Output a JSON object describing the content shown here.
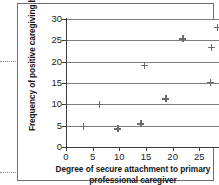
{
  "figure": {
    "margin_ticks": [
      "margin-tick-upper",
      "margin-tick-lower"
    ]
  },
  "chart_data": {
    "type": "scatter",
    "title": "",
    "subtitle": "",
    "xlabel": "Degree of secure attachment to primary professional caregiver",
    "xlabel_line1": "Degree of secure attachment to primary",
    "xlabel_line2": "professional caregiver",
    "ylabel": "Frequency of positive caregiving behaviour",
    "xlim": [
      0,
      30
    ],
    "ylim": [
      0,
      30
    ],
    "xticks": [
      0,
      5,
      10,
      15,
      20,
      25,
      30
    ],
    "yticks": [
      0,
      5,
      10,
      15,
      20,
      25,
      30
    ],
    "xtick_labels": [
      "0",
      "5",
      "10",
      "15",
      "20",
      "25",
      "30"
    ],
    "ytick_labels": [
      "0",
      "5",
      "10",
      "15",
      "20",
      "25",
      "30"
    ],
    "grid": true,
    "grid_axis": "y",
    "grid_values": [
      5,
      10,
      15,
      20,
      25,
      30
    ],
    "legend": null,
    "marker": "plus",
    "marker_color": "#6b6b6b",
    "axis_color": "#3a3a3a",
    "grid_color": "#7e7e7e",
    "series": [
      {
        "name": "caregivers",
        "points": [
          {
            "x": 3.3,
            "y": 4.8
          },
          {
            "x": 6.3,
            "y": 10.0
          },
          {
            "x": 9.7,
            "y": 4.3
          },
          {
            "x": 14.0,
            "y": 5.4
          },
          {
            "x": 14.7,
            "y": 19.1
          },
          {
            "x": 18.7,
            "y": 11.3
          },
          {
            "x": 21.9,
            "y": 25.4
          },
          {
            "x": 27.0,
            "y": 15.1
          },
          {
            "x": 27.2,
            "y": 23.3
          },
          {
            "x": 28.4,
            "y": 28.0
          }
        ]
      }
    ]
  }
}
